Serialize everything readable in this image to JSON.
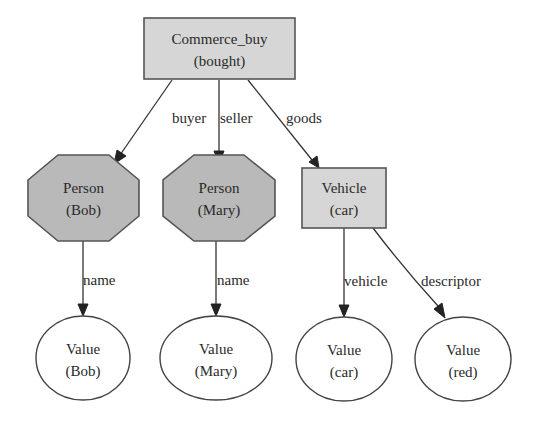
{
  "diagram": {
    "type": "directed-graph",
    "nodes": {
      "commerce": {
        "line1": "Commerce_buy",
        "line2": "(bought)",
        "shape": "box",
        "fill": "#d6d6d6"
      },
      "person_bob": {
        "line1": "Person",
        "line2": "(Bob)",
        "shape": "octagon",
        "fill": "#b9b9b9"
      },
      "person_mary": {
        "line1": "Person",
        "line2": "(Mary)",
        "shape": "octagon",
        "fill": "#b9b9b9"
      },
      "vehicle_car": {
        "line1": "Vehicle",
        "line2": "(car)",
        "shape": "box",
        "fill": "#d6d6d6"
      },
      "value_bob": {
        "line1": "Value",
        "line2": "(Bob)",
        "shape": "ellipse",
        "fill": "#ffffff"
      },
      "value_mary": {
        "line1": "Value",
        "line2": "(Mary)",
        "shape": "ellipse",
        "fill": "#ffffff"
      },
      "value_car": {
        "line1": "Value",
        "line2": "(car)",
        "shape": "ellipse",
        "fill": "#ffffff"
      },
      "value_red": {
        "line1": "Value",
        "line2": "(red)",
        "shape": "ellipse",
        "fill": "#ffffff"
      }
    },
    "edges": {
      "buyer": {
        "from": "commerce",
        "to": "person_bob",
        "label": "buyer"
      },
      "seller": {
        "from": "commerce",
        "to": "person_mary",
        "label": "seller"
      },
      "goods": {
        "from": "commerce",
        "to": "vehicle_car",
        "label": "goods"
      },
      "name_bob": {
        "from": "person_bob",
        "to": "value_bob",
        "label": "name"
      },
      "name_mary": {
        "from": "person_mary",
        "to": "value_mary",
        "label": "name"
      },
      "vehicle": {
        "from": "vehicle_car",
        "to": "value_car",
        "label": "vehicle"
      },
      "descriptor": {
        "from": "vehicle_car",
        "to": "value_red",
        "label": "descriptor"
      }
    }
  }
}
